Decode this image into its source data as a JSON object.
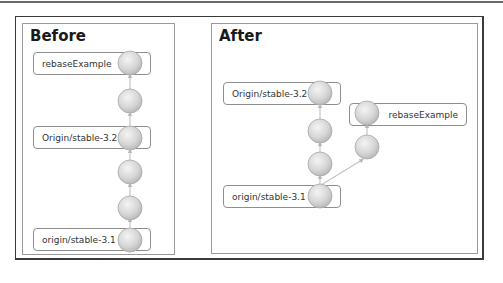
{
  "before": {
    "title": "Before",
    "labels": {
      "top": "rebaseExample",
      "middle": "Origin/stable-3.2",
      "bottom": "origin/stable-3.1"
    },
    "commits": 6
  },
  "after": {
    "title": "After",
    "labels": {
      "main_top": "Origin/stable-3.2",
      "branch_top": "rebaseExample",
      "main_bottom": "origin/stable-3.1"
    },
    "main_commits": 4,
    "branch_commits": 2
  },
  "colors": {
    "frame": "#3a3a3a",
    "panel_border": "#9a9a9a",
    "node_fill": "#d4d4d4",
    "edge": "#bdbdbd"
  }
}
